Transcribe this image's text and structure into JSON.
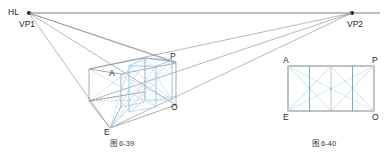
{
  "figure": {
    "title_left": "图 6-39",
    "title_right": "图 6-40",
    "horizon": {
      "label": "HL",
      "y": 13,
      "x_start": 30,
      "x_end": 380
    },
    "vanishing_points": [
      {
        "name": "VP1",
        "label": "VP1",
        "x": 29,
        "y": 13
      },
      {
        "name": "VP2",
        "label": "VP2",
        "x": 352,
        "y": 13
      }
    ],
    "left_figure": {
      "name": "two-point-perspective-box",
      "points": {
        "A": {
          "label": "A",
          "x": 113,
          "y": 76
        },
        "P": {
          "label": "P",
          "x": 175,
          "y": 62
        },
        "O": {
          "label": "O",
          "x": 175,
          "y": 105
        },
        "E": {
          "label": "E",
          "x": 110,
          "y": 128
        }
      }
    },
    "right_figure": {
      "name": "elevation-rectangle-divisions",
      "points": {
        "A": {
          "label": "A",
          "x": 288,
          "y": 66
        },
        "P": {
          "label": "P",
          "x": 374,
          "y": 66
        },
        "E": {
          "label": "E",
          "x": 288,
          "y": 111
        },
        "O": {
          "label": "O",
          "x": 374,
          "y": 111
        }
      },
      "division_count": 4
    },
    "colors": {
      "construction_line": "#6f6f6f",
      "accent_blue": "#7ab6e0",
      "accent_blue_light": "#aed6ee",
      "text": "#231f20",
      "box_outline": "#8a8a8a"
    }
  }
}
